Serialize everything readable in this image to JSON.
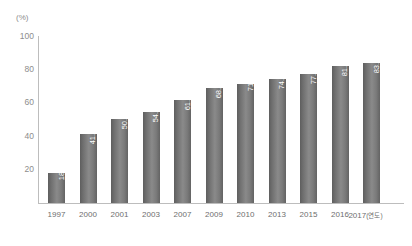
{
  "chart_data": {
    "type": "bar",
    "title": "",
    "subtitle": "",
    "xlabel": "(연도)",
    "ylabel": "(%)",
    "unit_label": "(%)",
    "categories": [
      "1997",
      "2000",
      "2001",
      "2003",
      "2007",
      "2009",
      "2010",
      "2013",
      "2015",
      "2016",
      "2017"
    ],
    "values": [
      18,
      41.5,
      50.4,
      54.7,
      61.7,
      68.7,
      71,
      74.4,
      77.2,
      81.9,
      83.8
    ],
    "value_labels": [
      "18",
      "41.5",
      "50.4",
      "54.7",
      "61.7",
      "68.7",
      "71",
      "74.4",
      "77.2",
      "81.9",
      "83.8"
    ],
    "ylim": [
      0,
      100
    ],
    "yticks": [
      100,
      80,
      60,
      40,
      20
    ],
    "ytick_labels": [
      "100",
      "80",
      "60",
      "40",
      "20"
    ],
    "grid": false,
    "legend": null,
    "legend_position": "none",
    "series": [
      {
        "name": "",
        "values": [
          18,
          41.5,
          50.4,
          54.7,
          61.7,
          68.7,
          71,
          74.4,
          77.2,
          81.9,
          83.8
        ]
      }
    ],
    "colors": {
      "bar_dark": "#5e5e5e",
      "bar_light": "#8a8a8a",
      "axis": "#bdbdbd",
      "tick_text": "#8d8d8d",
      "category_text": "#6e6e6e",
      "value_text": "#ffffff",
      "background": "#ffffff"
    },
    "last_category_note": "2017 (연도)"
  }
}
